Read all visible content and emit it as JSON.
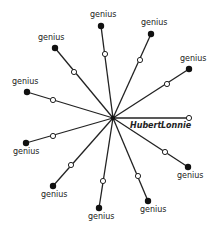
{
  "diagram": {
    "center": {
      "x": 113,
      "y": 118
    },
    "center_label_left": "Hubert",
    "center_label_right": "Lonnie",
    "spokes": [
      {
        "label": "genius",
        "end": [
          55,
          48
        ],
        "mid": [
          74,
          72
        ],
        "label_pos": [
          38,
          40
        ]
      },
      {
        "label": "genius",
        "end": [
          101,
          26
        ],
        "mid": [
          105,
          54
        ],
        "label_pos": [
          90,
          17
        ]
      },
      {
        "label": "genius",
        "end": [
          151,
          34
        ],
        "mid": [
          140,
          60
        ],
        "label_pos": [
          141,
          25
        ]
      },
      {
        "label": "genius",
        "end": [
          189,
          69
        ],
        "mid": [
          167,
          84
        ],
        "label_pos": [
          180,
          61
        ]
      },
      {
        "label": "genius",
        "end": [
          27,
          92
        ],
        "mid": [
          53,
          100
        ],
        "label_pos": [
          12,
          84
        ]
      },
      {
        "label": "genius",
        "end": [
          26,
          143
        ],
        "mid": [
          53,
          136
        ],
        "label_pos": [
          13,
          154
        ]
      },
      {
        "label": "genius",
        "end": [
          53,
          186
        ],
        "mid": [
          71,
          165
        ],
        "label_pos": [
          41,
          197
        ]
      },
      {
        "label": "genius",
        "end": [
          99,
          208
        ],
        "mid": [
          103,
          181
        ],
        "label_pos": [
          88,
          219
        ]
      },
      {
        "label": "genius",
        "end": [
          148,
          201
        ],
        "mid": [
          138,
          176
        ],
        "label_pos": [
          140,
          212
        ]
      },
      {
        "label": "genius",
        "end": [
          188,
          167
        ],
        "mid": [
          165,
          152
        ],
        "label_pos": [
          177,
          178
        ]
      }
    ],
    "hubert_lonnie_line": {
      "end": [
        189,
        118
      ],
      "end_style": "hollow"
    }
  }
}
